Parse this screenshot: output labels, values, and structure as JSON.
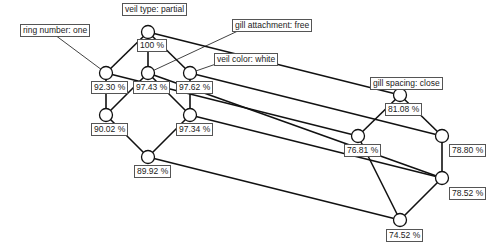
{
  "diagram": {
    "type": "concept-lattice",
    "attributes": [
      {
        "id": "veil_type",
        "label": "veil type: partial",
        "x": 122,
        "y": 3
      },
      {
        "id": "ring_number",
        "label": "ring number: one",
        "x": 20,
        "y": 24
      },
      {
        "id": "gill_attachment",
        "label": "gill attachment: free",
        "x": 232,
        "y": 19
      },
      {
        "id": "veil_color",
        "label": "veil color: white",
        "x": 214,
        "y": 53
      },
      {
        "id": "gill_spacing",
        "label": "gill spacing: close",
        "x": 370,
        "y": 77
      }
    ],
    "nodes": [
      {
        "id": "n0",
        "x": 148,
        "y": 32,
        "label": "100 %",
        "lx": 137,
        "ly": 39
      },
      {
        "id": "n1",
        "x": 106,
        "y": 73,
        "label": "92.30 %",
        "lx": 91,
        "ly": 81
      },
      {
        "id": "n2",
        "x": 148,
        "y": 73,
        "label": "97.43 %",
        "lx": 133,
        "ly": 81
      },
      {
        "id": "n3",
        "x": 190,
        "y": 73,
        "label": "97.62 %",
        "lx": 176,
        "ly": 81
      },
      {
        "id": "n4",
        "x": 106,
        "y": 115,
        "label": "90.02 %",
        "lx": 91,
        "ly": 123
      },
      {
        "id": "n5",
        "x": 190,
        "y": 115,
        "label": "97.34 %",
        "lx": 176,
        "ly": 123
      },
      {
        "id": "n6",
        "x": 148,
        "y": 157,
        "label": "89.92 %",
        "lx": 134,
        "ly": 165
      },
      {
        "id": "n7",
        "x": 400,
        "y": 95,
        "label": "81.08 %",
        "lx": 385,
        "ly": 103
      },
      {
        "id": "n8",
        "x": 358,
        "y": 136,
        "label": "76.81 %",
        "lx": 344,
        "ly": 144
      },
      {
        "id": "n9",
        "x": 442,
        "y": 136,
        "label": "78.80 %",
        "lx": 449,
        "ly": 144
      },
      {
        "id": "n10",
        "x": 442,
        "y": 178,
        "label": "78.52 %",
        "lx": 449,
        "ly": 187
      },
      {
        "id": "n11",
        "x": 400,
        "y": 220,
        "label": "74.52 %",
        "lx": 386,
        "ly": 229
      }
    ],
    "edges": [
      [
        "n0",
        "n1"
      ],
      [
        "n0",
        "n2"
      ],
      [
        "n0",
        "n3"
      ],
      [
        "n1",
        "n4"
      ],
      [
        "n2",
        "n4"
      ],
      [
        "n2",
        "n5"
      ],
      [
        "n3",
        "n5"
      ],
      [
        "n4",
        "n6"
      ],
      [
        "n5",
        "n6"
      ],
      [
        "n7",
        "n8"
      ],
      [
        "n7",
        "n9"
      ],
      [
        "n8",
        "n11"
      ],
      [
        "n9",
        "n10"
      ],
      [
        "n10",
        "n11"
      ],
      [
        "n0",
        "n7"
      ],
      [
        "n1",
        "n8"
      ],
      [
        "n2",
        "n10"
      ],
      [
        "n3",
        "n9"
      ],
      [
        "n5",
        "n10"
      ],
      [
        "n6",
        "n11"
      ]
    ],
    "pointers": [
      {
        "from": "ring_number",
        "x1": 55,
        "y1": 35,
        "to": "n1"
      },
      {
        "from": "gill_attachment",
        "x1": 240,
        "y1": 30,
        "to": "n2"
      },
      {
        "from": "veil_color",
        "x1": 216,
        "y1": 64,
        "to": "n3"
      }
    ],
    "colors": {
      "line": "#111111",
      "node_fill": "#ffffff",
      "border": "#555555"
    }
  }
}
